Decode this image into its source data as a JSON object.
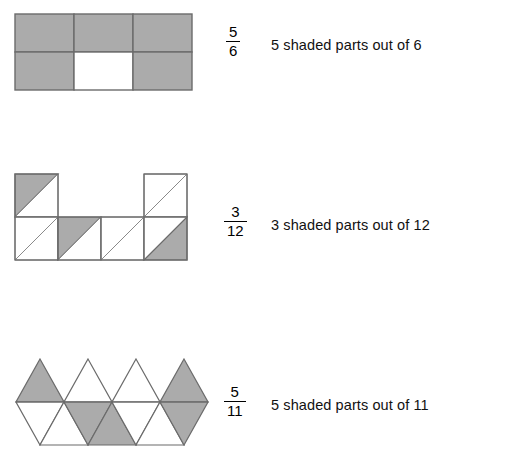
{
  "page": {
    "background_color": "#ffffff",
    "shade_color": "#ababab",
    "stroke_color": "#6b6b6b",
    "text_color": "#111111"
  },
  "examples": [
    {
      "id": "rectangles-5-6",
      "shape_kind": "rectangle-grid",
      "columns": 3,
      "rows": 2,
      "total_parts": 6,
      "shaded_parts": 5,
      "cells_shaded": [
        true,
        true,
        true,
        true,
        false,
        true
      ],
      "fraction": {
        "numerator": "5",
        "denominator": "6"
      },
      "caption": "5 shaded parts out of 6"
    },
    {
      "id": "triangles-in-squares-3-12",
      "shape_kind": "split-square-staircase",
      "total_parts": 12,
      "shaded_parts": 3,
      "squares": [
        {
          "col": 0,
          "row": 0,
          "upper_left_shaded": true,
          "lower_right_shaded": false
        },
        {
          "col": 3,
          "row": 0,
          "upper_left_shaded": false,
          "lower_right_shaded": false
        },
        {
          "col": 0,
          "row": 1,
          "upper_left_shaded": false,
          "lower_right_shaded": false
        },
        {
          "col": 1,
          "row": 1,
          "upper_left_shaded": true,
          "lower_right_shaded": false
        },
        {
          "col": 2,
          "row": 1,
          "upper_left_shaded": false,
          "lower_right_shaded": false
        },
        {
          "col": 3,
          "row": 1,
          "upper_left_shaded": false,
          "lower_right_shaded": true
        }
      ],
      "fraction": {
        "numerator": "3",
        "denominator": "12"
      },
      "caption": "3 shaded parts out of 12"
    },
    {
      "id": "triangle-strip-5-11",
      "shape_kind": "triangle-strip",
      "total_parts": 11,
      "shaded_parts": 5,
      "top_row_up_triangles": 4,
      "top_row_shaded_index": [
        0,
        3
      ],
      "bottom_row_triangles": 7,
      "bottom_row_shaded_index": [
        2,
        3,
        6
      ],
      "fraction": {
        "numerator": "5",
        "denominator": "11"
      },
      "caption": "5 shaded parts out of 11"
    }
  ]
}
